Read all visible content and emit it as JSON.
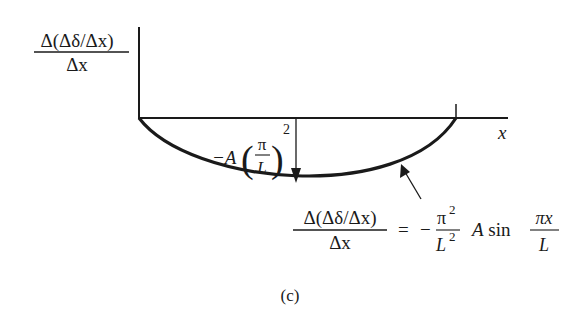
{
  "figure": {
    "caption": "(c)",
    "y_axis_label": {
      "numerator": "Δ(Δδ/Δx)",
      "denominator": "Δx"
    },
    "x_axis_label": "x",
    "min_label": {
      "prefix": "−A",
      "frac_num": "π",
      "frac_den": "L",
      "exponent": "2"
    },
    "equation": {
      "lhs_num": "Δ(Δδ/Δx)",
      "lhs_den": "Δx",
      "equals": "=",
      "minus": "−",
      "coef_num": "π",
      "coef_num_exp": "2",
      "coef_den": "L",
      "coef_den_exp": "2",
      "term": "A sin",
      "arg_num": "πx",
      "arg_den": "L"
    },
    "colors": {
      "ink": "#1a1a1a",
      "background": "#ffffff"
    }
  }
}
